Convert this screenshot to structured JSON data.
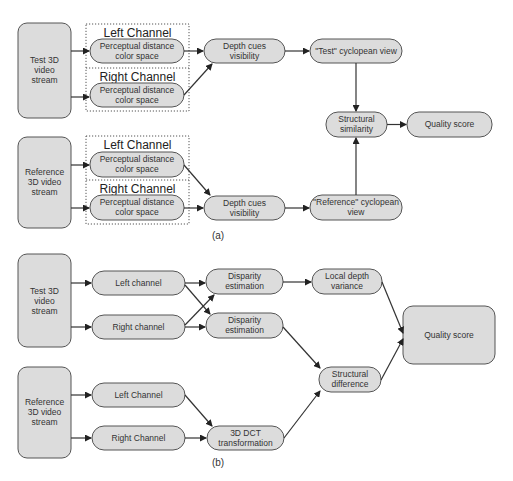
{
  "diagram_a": {
    "caption": "(a)",
    "test_stream": [
      "Test 3D",
      "video",
      "stream"
    ],
    "reference_stream": [
      "Reference",
      "3D video",
      "stream"
    ],
    "test_group": {
      "left_title": "Left Channel",
      "right_title": "Right Channel",
      "left_node": [
        "Perceptual distance",
        "color space"
      ],
      "right_node": [
        "Perceptual distance",
        "color space"
      ]
    },
    "reference_group": {
      "left_title": "Left Channel",
      "right_title": "Right Channel",
      "left_node": [
        "Perceptual distance",
        "color space"
      ],
      "right_node": [
        "Perceptual distance",
        "color space"
      ]
    },
    "depth_cues_test": [
      "Depth cues",
      "visibility"
    ],
    "depth_cues_reference": [
      "Depth cues",
      "visibility"
    ],
    "test_cyclopean": [
      "\"Test\" cyclopean view"
    ],
    "reference_cyclopean": [
      "\"Reference\" cyclopean",
      "view"
    ],
    "structural_similarity": [
      "Structural",
      "similarity"
    ],
    "quality_score": [
      "Quality score"
    ]
  },
  "diagram_b": {
    "caption": "(b)",
    "test_stream": [
      "Test 3D",
      "video",
      "stream"
    ],
    "reference_stream": [
      "Reference",
      "3D video",
      "stream"
    ],
    "test_left": [
      "Left channel"
    ],
    "test_right": [
      "Right channel"
    ],
    "disparity_1": [
      "Disparity",
      "estimation"
    ],
    "disparity_2": [
      "Disparity",
      "estimation"
    ],
    "local_depth_variance": [
      "Local depth",
      "variance"
    ],
    "ref_left": [
      "Left Channel"
    ],
    "ref_right": [
      "Right Channel"
    ],
    "dct": [
      "3D DCT",
      "transformation"
    ],
    "structural_difference": [
      "Structural",
      "difference"
    ],
    "quality_score": [
      "Quality score"
    ]
  },
  "colors": {
    "node_fill": "#dcdcdc",
    "node_stroke": "#555555",
    "edge": "#333333"
  }
}
